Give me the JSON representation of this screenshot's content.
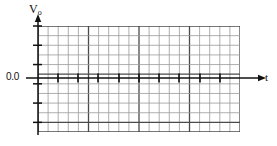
{
  "figure": {
    "kind": "grid-plot",
    "background_color": "#ffffff",
    "width": 277,
    "height": 146
  },
  "axes": {
    "y": {
      "label": "V",
      "label_subscript": "o",
      "label_full": "Vo",
      "arrow": true,
      "line_color": "#1a1a1a",
      "tick_count": 6,
      "zero_value_label": "0.0"
    },
    "x": {
      "label": "t",
      "arrow": true,
      "line_color": "#1a1a1a",
      "tick_count": 10
    }
  },
  "grid": {
    "columns": 20,
    "rows": 11,
    "cell_width": 10.1,
    "cell_height": 9.64,
    "minor_color": "#9b9b9b",
    "major_color": "#4a4a4a",
    "major_every_columns": 5,
    "major_every_rows": 5,
    "left": 38,
    "top": 26,
    "width": 202,
    "height": 106
  },
  "zero_line": {
    "y_row_index": 5,
    "y_pixel": 78,
    "color": "#111111",
    "thickness": 1.6,
    "label": "0.0"
  },
  "tick_marks_on_zero_line": {
    "description": "short vertical dashes crossing the zero line",
    "color": "#111111",
    "height": 9,
    "thickness": 1.6,
    "x_positions": [
      58,
      78,
      98,
      119,
      139,
      159,
      179,
      200,
      220
    ]
  },
  "chart_data": {
    "type": "line",
    "title": "",
    "xlabel": "t",
    "ylabel": "Vo",
    "grid": true,
    "legend": null,
    "x": [
      58,
      78,
      98,
      119,
      139,
      159,
      179,
      200,
      220
    ],
    "series": [
      {
        "name": "Vo",
        "values": [
          0,
          0,
          0,
          0,
          0,
          0,
          0,
          0,
          0
        ],
        "note": "trace lies flat along the 0.0 line with periodic vertical markers"
      }
    ],
    "xlim": [
      0,
      20
    ],
    "ylim": [
      -6,
      5
    ],
    "annotations": [
      {
        "text": "0.0",
        "x": 0,
        "y": 0
      }
    ]
  }
}
